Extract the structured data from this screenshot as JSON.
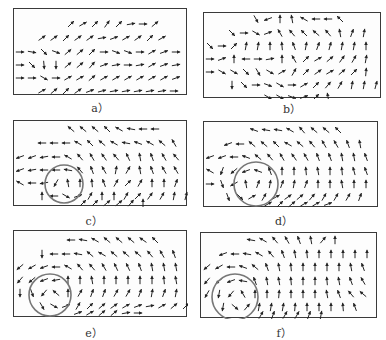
{
  "figure": {
    "panels": [
      {
        "id": "a",
        "label": "a）",
        "box": {
          "x": 13,
          "y": 8,
          "w": 174,
          "h": 87
        },
        "caption_pos": {
          "x": 80,
          "y": 99
        },
        "circle": null,
        "rows": [
          {
            "y": 15,
            "x0": 57,
            "dx": 12,
            "angles": [
              45,
              30,
              45,
              55,
              45,
              10,
              0,
              40
            ]
          },
          {
            "y": 29,
            "x0": 28,
            "dx": 12,
            "angles": [
              35,
              35,
              45,
              35,
              35,
              10,
              20,
              30,
              35,
              45,
              30
            ]
          },
          {
            "y": 43,
            "x0": 6,
            "dx": 12,
            "angles": [
              0,
              -10,
              -45,
              -20,
              40,
              40,
              45,
              0,
              -20,
              -20,
              0,
              30,
              20,
              0
            ]
          },
          {
            "y": 56,
            "x0": 6,
            "dx": 12,
            "angles": [
              0,
              -45,
              -85,
              -90,
              40,
              40,
              50,
              20,
              10,
              0,
              10,
              30,
              20,
              10
            ]
          },
          {
            "y": 69,
            "x0": 6,
            "dx": 12,
            "angles": [
              0,
              0,
              -30,
              0,
              30,
              30,
              40,
              30,
              30,
              30,
              30,
              30,
              30,
              20
            ]
          },
          {
            "y": 82,
            "x0": 28,
            "dx": 12,
            "angles": [
              30,
              40,
              45,
              35,
              20,
              15,
              10,
              10,
              10,
              10,
              10,
              0
            ]
          }
        ],
        "bottom_row": {
          "y": 90,
          "x0": 69,
          "dx": 12,
          "angles": [
            45,
            20,
            0,
            0,
            0,
            10,
            0
          ]
        }
      },
      {
        "id": "b",
        "label": "b）",
        "box": {
          "x": 203,
          "y": 12,
          "w": 178,
          "h": 86
        },
        "caption_pos": {
          "x": 272,
          "y": 100
        },
        "circle": null,
        "rows": [
          {
            "y": 6,
            "x0": 52,
            "dx": 12,
            "angles": [
              -60,
              200,
              90,
              100,
              150,
              180,
              180,
              135
            ]
          },
          {
            "y": 20,
            "x0": 28,
            "dx": 12,
            "angles": [
              -45,
              0,
              -30,
              20,
              120,
              130,
              135,
              140,
              130,
              100,
              70,
              80
            ]
          },
          {
            "y": 33,
            "x0": 6,
            "dx": 12,
            "angles": [
              -45,
              0,
              45,
              80,
              80,
              90,
              95,
              110,
              80,
              70,
              75,
              80,
              80,
              90
            ]
          },
          {
            "y": 46,
            "x0": 6,
            "dx": 12,
            "angles": [
              0,
              20,
              90,
              180,
              0,
              10,
              90,
              120,
              45,
              30,
              40,
              55,
              60,
              80
            ]
          },
          {
            "y": 59,
            "x0": 6,
            "dx": 12,
            "angles": [
              0,
              -30,
              -30,
              -45,
              -60,
              -30,
              30,
              60,
              45,
              35,
              30,
              40,
              45,
              85
            ]
          },
          {
            "y": 72,
            "x0": 28,
            "dx": 12,
            "angles": [
              -90,
              -45,
              0,
              -20,
              -30,
              0,
              30,
              45,
              50,
              60,
              80,
              80,
              75
            ]
          }
        ],
        "bottom_row": {
          "y": 84,
          "x0": 64,
          "dx": 12,
          "angles": [
            -30,
            -30,
            -20,
            20,
            45,
            100
          ]
        }
      },
      {
        "id": "c",
        "label": "c）",
        "box": {
          "x": 13,
          "y": 120,
          "w": 174,
          "h": 86
        },
        "caption_pos": {
          "x": 74,
          "y": 212
        },
        "circle": {
          "cx": 50,
          "cy": 63,
          "r": 19
        },
        "rows": [
          {
            "y": 8,
            "x0": 57,
            "dx": 12,
            "angles": [
              140,
              140,
              140,
              135,
              150,
              170,
              180,
              180
            ]
          },
          {
            "y": 22,
            "x0": 28,
            "dx": 12,
            "angles": [
              180,
              180,
              180,
              150,
              135,
              140,
              150,
              170,
              160,
              150,
              140,
              120
            ]
          },
          {
            "y": 36,
            "x0": 6,
            "dx": 12,
            "angles": [
              200,
              200,
              190,
              180,
              150,
              130,
              120,
              125,
              130,
              115,
              100,
              110,
              120,
              130
            ]
          },
          {
            "y": 49,
            "x0": 6,
            "dx": 12,
            "angles": [
              200,
              190,
              180,
              180,
              170,
              130,
              110,
              120,
              80,
              60,
              100,
              110,
              120,
              120
            ]
          },
          {
            "y": 62,
            "x0": 6,
            "dx": 12,
            "angles": [
              150,
              180,
              190,
              240,
              100,
              90,
              95,
              110,
              60,
              45,
              60,
              90,
              90,
              70
            ]
          },
          {
            "y": 75,
            "x0": 28,
            "dx": 12,
            "angles": [
              90,
              180,
              -30,
              20,
              60,
              90,
              90,
              60,
              45,
              55,
              60,
              80,
              75
            ]
          }
        ],
        "bottom_row": {
          "y": 82,
          "x0": 69,
          "dx": 12,
          "angles": [
            45,
            45,
            40,
            40,
            50,
            90
          ]
        }
      },
      {
        "id": "d",
        "label": "d）",
        "box": {
          "x": 203,
          "y": 121,
          "w": 175,
          "h": 86
        },
        "caption_pos": {
          "x": 264,
          "y": 212
        },
        "circle": {
          "cx": 52,
          "cy": 62,
          "r": 22
        },
        "rows": [
          {
            "y": 8,
            "x0": 50,
            "dx": 12,
            "angles": [
              160,
              170,
              170,
              150,
              130,
              140,
              140,
              135
            ]
          },
          {
            "y": 22,
            "x0": 24,
            "dx": 12,
            "angles": [
              200,
              180,
              140,
              140,
              135,
              150,
              140,
              130,
              120,
              120,
              110,
              100
            ]
          },
          {
            "y": 35,
            "x0": 6,
            "dx": 12,
            "angles": [
              200,
              200,
              180,
              160,
              140,
              130,
              120,
              125,
              120,
              110,
              110,
              100,
              100,
              110
            ]
          },
          {
            "y": 49,
            "x0": 6,
            "dx": 12,
            "angles": [
              150,
              250,
              220,
              200,
              160,
              110,
              90,
              90,
              95,
              100,
              90,
              95,
              105,
              110
            ]
          },
          {
            "y": 62,
            "x0": 6,
            "dx": 12,
            "angles": [
              0,
              -70,
              210,
              100,
              70,
              80,
              70,
              80,
              70,
              90,
              90,
              100,
              90,
              90
            ]
          },
          {
            "y": 75,
            "x0": 24,
            "dx": 12,
            "angles": [
              -70,
              -45,
              30,
              60,
              30,
              35,
              40,
              50,
              60,
              60,
              60,
              70
            ]
          }
        ],
        "bottom_row": {
          "y": 82,
          "x0": 64,
          "dx": 12,
          "angles": [
            30,
            45,
            40,
            30,
            30,
            20
          ]
        }
      },
      {
        "id": "e",
        "label": "e）",
        "box": {
          "x": 13,
          "y": 230,
          "w": 174,
          "h": 87
        },
        "caption_pos": {
          "x": 74,
          "y": 324
        },
        "circle": {
          "cx": 36,
          "cy": 64,
          "r": 21
        },
        "rows": [
          {
            "y": 9,
            "x0": 57,
            "dx": 12,
            "angles": [
              180,
              170,
              150,
              140,
              140,
              140,
              145,
              135
            ]
          },
          {
            "y": 23,
            "x0": 28,
            "dx": 12,
            "angles": [
              -90,
              180,
              180,
              170,
              140,
              150,
              140,
              140,
              140,
              130,
              120,
              110
            ]
          },
          {
            "y": 36,
            "x0": 6,
            "dx": 12,
            "angles": [
              220,
              210,
              200,
              180,
              150,
              130,
              130,
              120,
              115,
              115,
              110,
              100,
              100,
              100
            ]
          },
          {
            "y": 49,
            "x0": 6,
            "dx": 12,
            "angles": [
              230,
              220,
              200,
              190,
              90,
              90,
              100,
              90,
              90,
              90,
              90,
              90,
              95,
              100
            ]
          },
          {
            "y": 62,
            "x0": 6,
            "dx": 12,
            "angles": [
              -90,
              -70,
              230,
              140,
              90,
              60,
              70,
              70,
              60,
              60,
              70,
              80,
              70,
              80
            ]
          },
          {
            "y": 75,
            "x0": 28,
            "dx": 12,
            "angles": [
              -60,
              -30,
              20,
              60,
              45,
              40,
              35,
              30,
              20,
              10,
              30,
              40,
              45
            ]
          }
        ],
        "bottom_row": {
          "y": 82,
          "x0": 64,
          "dx": 12,
          "angles": [
            20,
            30,
            40,
            40,
            10,
            0
          ]
        }
      },
      {
        "id": "f",
        "label": "f）",
        "box": {
          "x": 200,
          "y": 232,
          "w": 177,
          "h": 86
        },
        "caption_pos": {
          "x": 264,
          "y": 324
        },
        "circle": {
          "cx": 34,
          "cy": 64,
          "r": 23
        },
        "rows": [
          {
            "y": 7,
            "x0": 50,
            "dx": 12,
            "angles": [
              170,
              150,
              130,
              120,
              110,
              100,
              50,
              90
            ]
          },
          {
            "y": 21,
            "x0": 22,
            "dx": 12,
            "angles": [
              200,
              180,
              170,
              150,
              130,
              110,
              100,
              95,
              90,
              90,
              90,
              90,
              90
            ]
          },
          {
            "y": 34,
            "x0": 6,
            "dx": 12,
            "angles": [
              220,
              210,
              180,
              160,
              140,
              110,
              100,
              95,
              90,
              90,
              90,
              90,
              100,
              110
            ]
          },
          {
            "y": 48,
            "x0": 6,
            "dx": 12,
            "angles": [
              230,
              220,
              200,
              170,
              110,
              100,
              100,
              95,
              90,
              90,
              95,
              100,
              110,
              120
            ]
          },
          {
            "y": 61,
            "x0": 6,
            "dx": 12,
            "angles": [
              240,
              -100,
              230,
              120,
              90,
              90,
              85,
              90,
              90,
              90,
              100,
              110,
              130,
              140
            ]
          },
          {
            "y": 74,
            "x0": 22,
            "dx": 12,
            "angles": [
              -100,
              -40,
              50,
              80,
              80,
              80,
              85,
              90,
              90,
              90,
              95,
              110
            ]
          }
        ],
        "bottom_row": {
          "y": 82,
          "x0": 60,
          "dx": 12,
          "angles": [
            60,
            70,
            60,
            60,
            70,
            80
          ]
        }
      }
    ]
  }
}
